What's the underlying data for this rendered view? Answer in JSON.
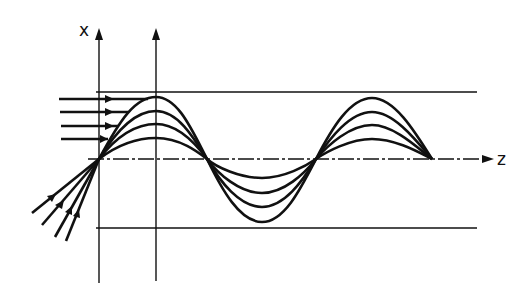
{
  "diagram": {
    "type": "waveguide-ray-trajectories",
    "axes": {
      "vertical_label": "x",
      "horizontal_label": "z"
    },
    "colors": {
      "ink": "#111111",
      "background": "#ffffff"
    },
    "guide": {
      "top_boundary_y": 92,
      "bottom_boundary_y": 228,
      "axis_y": 159,
      "reference_verticals_x": [
        99,
        156
      ]
    },
    "rays": {
      "count": 4,
      "amplitudes_px": [
        62,
        48,
        35,
        21
      ],
      "crossing_points_x": [
        99,
        207,
        316,
        432
      ],
      "incoming_horizontal": {
        "start_x": 59,
        "y": [
          99,
          112,
          126,
          139
        ]
      },
      "incoming_oblique": "converging to focus at (99,159)"
    }
  }
}
